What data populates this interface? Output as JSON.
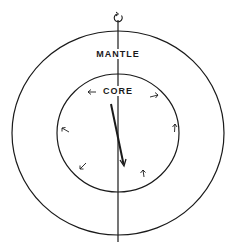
{
  "diagram": {
    "labels": {
      "mantle": "MANTLE",
      "core": "CORE"
    },
    "colors": {
      "background": "#ffffff",
      "stroke": "#1a1a1a"
    },
    "elements": {
      "rotation_axis": {
        "icon": "rotation-arrow-icon",
        "x": 118,
        "y_top": 12,
        "y_bottom": 242
      },
      "mantle_boundary": {
        "cx": 118,
        "cy": 133,
        "rx": 106,
        "ry": 102
      },
      "core_boundary": {
        "cx": 118,
        "cy": 133,
        "rx": 61,
        "ry": 59
      },
      "compass_needle": {
        "x1": 111,
        "y1": 104,
        "x2": 124,
        "y2": 166
      },
      "core_flow_arrows": [
        {
          "x": 92,
          "y": 92,
          "direction": "left"
        },
        {
          "x": 154,
          "y": 96,
          "direction": "right"
        },
        {
          "x": 66,
          "y": 130,
          "direction": "up-left"
        },
        {
          "x": 175,
          "y": 128,
          "direction": "up"
        },
        {
          "x": 82,
          "y": 167,
          "direction": "down-left"
        },
        {
          "x": 143,
          "y": 173,
          "direction": "up"
        }
      ]
    }
  }
}
